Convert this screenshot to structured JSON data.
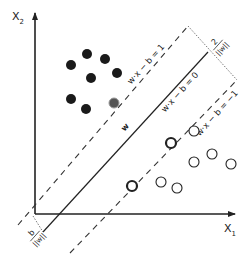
{
  "axes": {
    "x_label": "X",
    "x_sub": "1",
    "y_label": "X",
    "y_sub": "2"
  },
  "lines": {
    "hyperplane_label": "w·x − b = 0",
    "upper_margin_label": "w·x − b = 1",
    "lower_margin_label": "w·x − b = −1",
    "normal_label": "w"
  },
  "annotations": {
    "margin_width_num": "2",
    "margin_width_den": "||w||",
    "offset_num": "b",
    "offset_den": "||w||"
  },
  "colors": {
    "ink": "#222222",
    "filled_point": "#1a1a1a",
    "support_vector_filled": "#555555",
    "background": "#ffffff"
  },
  "points": {
    "class_filled": [
      {
        "x": 71,
        "y": 65
      },
      {
        "x": 87,
        "y": 54
      },
      {
        "x": 105,
        "y": 59
      },
      {
        "x": 117,
        "y": 73
      },
      {
        "x": 91,
        "y": 78
      },
      {
        "x": 71,
        "y": 99
      },
      {
        "x": 86,
        "y": 109
      }
    ],
    "class_filled_support": [
      {
        "x": 114,
        "y": 103
      }
    ],
    "class_open": [
      {
        "x": 194,
        "y": 131
      },
      {
        "x": 212,
        "y": 154
      },
      {
        "x": 194,
        "y": 162
      },
      {
        "x": 231,
        "y": 164
      },
      {
        "x": 161,
        "y": 182
      },
      {
        "x": 177,
        "y": 188
      }
    ],
    "class_open_support": [
      {
        "x": 171,
        "y": 143
      },
      {
        "x": 132,
        "y": 186
      }
    ]
  }
}
